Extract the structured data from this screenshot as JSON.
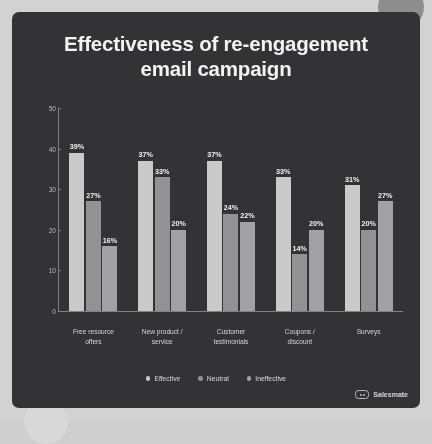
{
  "brand": {
    "name": "Salesmate",
    "mark_icon": "salesmate-logo-icon"
  },
  "colors": {
    "card_background": "#323234",
    "title_text": "#f2f2f2",
    "axis": "#7d7d7f",
    "effective": "#c9c9c9",
    "neutral": "#909092",
    "ineffective": "#a0a0a2"
  },
  "chart_data": {
    "type": "bar",
    "title_line1": "Effectiveness of re-engagement",
    "title_line2": "email campaign",
    "title": "Effectiveness of re-engagement email campaign",
    "xlabel": "",
    "ylabel": "",
    "ylim": [
      0,
      50
    ],
    "yticks": [
      0,
      10,
      20,
      30,
      40,
      50
    ],
    "ytick_labels": [
      "0",
      "10",
      "20",
      "30",
      "40",
      "50"
    ],
    "grid": false,
    "legend_position": "bottom",
    "value_suffix": "%",
    "categories": [
      "Free resource\noffers",
      "New product /\nservice",
      "Customer\ntestimonials",
      "Coupons /\ndiscount",
      "Surveys"
    ],
    "category_lines": [
      [
        "Free resource",
        "offers"
      ],
      [
        "New product /",
        "service"
      ],
      [
        "Customer",
        "testimonials"
      ],
      [
        "Coupons /",
        "discount"
      ],
      [
        "Surveys"
      ]
    ],
    "series": [
      {
        "name": "Effective",
        "color": "#c9c9c9",
        "values": [
          39,
          37,
          37,
          33,
          31
        ],
        "labels": [
          "39%",
          "37%",
          "37%",
          "33%",
          "31%"
        ]
      },
      {
        "name": "Neutral",
        "color": "#909092",
        "values": [
          27,
          33,
          24,
          14,
          20
        ],
        "labels": [
          "27%",
          "33%",
          "24%",
          "14%",
          "20%"
        ]
      },
      {
        "name": "Ineffective",
        "color": "#a0a0a2",
        "values": [
          16,
          20,
          22,
          20,
          27
        ],
        "labels": [
          "16%",
          "20%",
          "22%",
          "20%",
          "27%"
        ]
      }
    ]
  }
}
